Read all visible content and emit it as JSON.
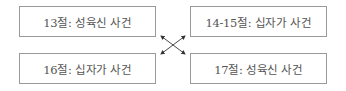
{
  "boxes": {
    "top_left": "13절: 성육신 사건",
    "top_right": "14-15절: 십자가 사건",
    "bottom_left": "16절: 십자가 사건",
    "bottom_right": "17절: 성육신 사건"
  },
  "connector": "cross-arrows"
}
